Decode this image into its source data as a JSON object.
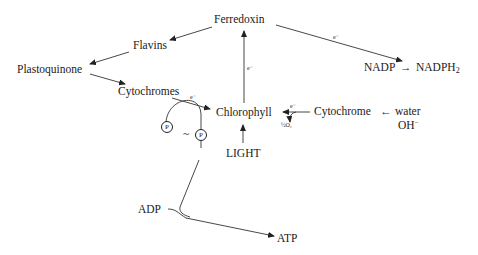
{
  "diagram": {
    "nodes": {
      "ferredoxin": "Ferredoxin",
      "flavins": "Flavins",
      "plastoquinone": "Plastoquinone",
      "cytochromes": "Cytochromes",
      "chlorophyll": "Chlorophyll",
      "cytochrome": "Cytochrome",
      "water": "water",
      "oh": "OH",
      "oh_charge": "−",
      "light": "LIGHT",
      "nadp": "NADP",
      "nadph": "NADPH",
      "nadph_sub": "2",
      "adp": "ADP",
      "atp": "ATP",
      "half_o2": "½O₂",
      "phosphate": "P",
      "tilde": "~"
    },
    "edge_labels": {
      "electron": "e⁻"
    },
    "edges": [
      {
        "from": "Ferredoxin",
        "to": "Flavins"
      },
      {
        "from": "Flavins",
        "to": "Plastoquinone"
      },
      {
        "from": "Plastoquinone",
        "to": "Cytochromes"
      },
      {
        "from": "Cytochromes",
        "to": "Chlorophyll",
        "label": "e⁻"
      },
      {
        "from": "Chlorophyll",
        "to": "Ferredoxin",
        "label": "e⁻"
      },
      {
        "from": "Ferredoxin",
        "to": "NADP",
        "label": "e⁻"
      },
      {
        "from": "NADP",
        "to": "NADPH₂"
      },
      {
        "from": "Cytochrome",
        "to": "Chlorophyll",
        "label": "e⁻"
      },
      {
        "from": "Cytochrome",
        "to": "½O₂"
      },
      {
        "from": "water",
        "to": "Cytochrome"
      },
      {
        "from": "LIGHT",
        "to": "Chlorophyll"
      },
      {
        "from": "ADP",
        "to": "ATP"
      }
    ]
  }
}
